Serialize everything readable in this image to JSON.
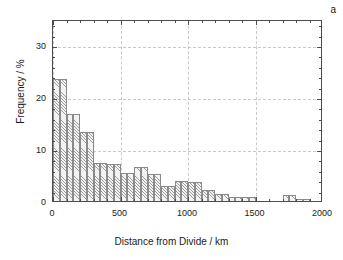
{
  "chart_data": {
    "type": "bar",
    "title": "",
    "panel_label": "a",
    "xlabel": "Distance from Divide / km",
    "ylabel": "Frequency / %",
    "xlim": [
      0,
      2000
    ],
    "ylim": [
      0,
      35
    ],
    "bin_width": 50,
    "grid": true,
    "legend": null,
    "xticks": [
      0,
      500,
      1000,
      1500,
      2000
    ],
    "xticklabels": [
      "0",
      "500",
      "1000",
      "1500",
      "2000"
    ],
    "xticks_minor": [
      100,
      200,
      300,
      400,
      600,
      700,
      800,
      900,
      1100,
      1200,
      1300,
      1400,
      1600,
      1700,
      1800,
      1900
    ],
    "yticks": [
      0,
      10,
      20,
      30
    ],
    "yticklabels": [
      "0",
      "10",
      "20",
      "30"
    ],
    "yticks_minor": [
      2,
      4,
      6,
      8,
      12,
      14,
      16,
      18,
      22,
      24,
      26,
      28,
      32,
      34
    ],
    "bin_starts": [
      0,
      50,
      100,
      150,
      200,
      250,
      300,
      350,
      400,
      450,
      500,
      550,
      600,
      650,
      700,
      750,
      800,
      850,
      900,
      950,
      1000,
      1050,
      1100,
      1150,
      1200,
      1250,
      1300,
      1350,
      1400,
      1450,
      1500,
      1550,
      1600,
      1650,
      1700,
      1750,
      1800,
      1850,
      1900,
      1950
    ],
    "values": [
      23.4,
      23.4,
      16.8,
      16.8,
      13.2,
      13.2,
      7.3,
      7.3,
      7.1,
      7.1,
      5.3,
      5.3,
      6.6,
      6.6,
      5.2,
      5.2,
      2.9,
      2.9,
      3.9,
      3.9,
      3.7,
      3.7,
      2.1,
      2.1,
      1.3,
      1.3,
      0.7,
      0.7,
      0.7,
      0.7,
      0.0,
      0.0,
      0.0,
      0.0,
      1.1,
      1.1,
      0.35,
      0.35,
      0.0,
      0.0
    ],
    "bar_fill_color": "#f2f2f2",
    "bar_edge_color": "#8a8a8a",
    "axis_color": "#4d4d4d",
    "grid_color": "#c9c9c9"
  }
}
